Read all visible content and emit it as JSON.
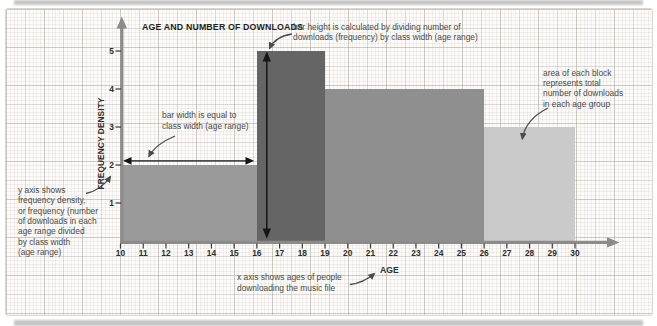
{
  "title": "AGE AND NUMBER OF DOWNLOADS",
  "annotations": {
    "bar_height": "bar height is calculated by dividing number of\ndownloads (frequency) by class width (age range)",
    "bar_width": "bar width is equal to\nclass width (age range)",
    "area": "area of each block\nrepresents total\nnumber of downloads\nin each age group",
    "y_axis": "y axis shows\nfrequency density,\nor frequency (number\nof downloads in each\nage range divided\nby class width\n(age range)",
    "x_axis": "x axis shows ages of people\ndownloading the music file"
  },
  "chart_data": {
    "type": "bar",
    "subtype": "histogram",
    "title": "AGE AND NUMBER OF DOWNLOADS",
    "xlabel": "AGE",
    "ylabel": "FREQUENCY DENSITY",
    "xlim": [
      10,
      30
    ],
    "ylim": [
      0,
      5
    ],
    "x_ticks": [
      10,
      11,
      12,
      13,
      14,
      15,
      16,
      17,
      18,
      19,
      20,
      21,
      22,
      23,
      24,
      25,
      26,
      27,
      28,
      29,
      30
    ],
    "y_ticks": [
      1,
      2,
      3,
      4,
      5
    ],
    "grid": true,
    "legend": false,
    "axis_color": "#8b8b8b",
    "bins": [
      {
        "age_range": [
          10,
          16
        ],
        "frequency_density": 2,
        "color": "#9a9a9a"
      },
      {
        "age_range": [
          16,
          19
        ],
        "frequency_density": 5,
        "color": "#656565"
      },
      {
        "age_range": [
          19,
          26
        ],
        "frequency_density": 4,
        "color": "#8f8f8f"
      },
      {
        "age_range": [
          26,
          30
        ],
        "frequency_density": 3,
        "color": "#cacaca"
      }
    ]
  }
}
